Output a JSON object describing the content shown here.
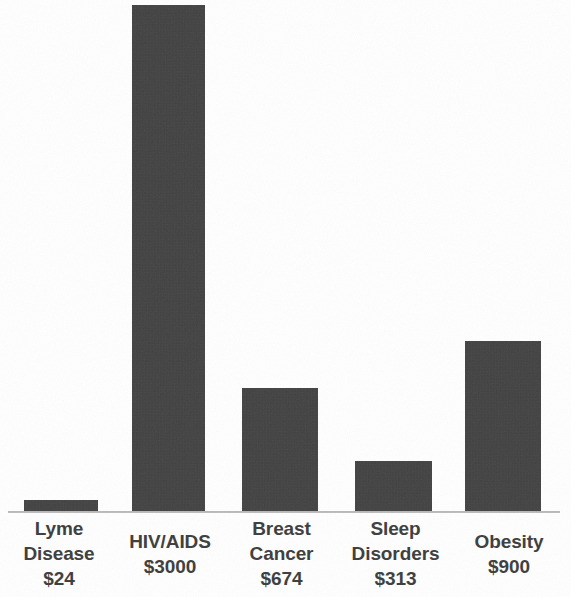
{
  "chart_data": {
    "type": "bar",
    "title": "",
    "subtitle": "",
    "xlabel": "",
    "ylabel": "",
    "categories": [
      "Lyme Disease",
      "HIV/AIDS",
      "Breast Cancer",
      "Sleep Disorders",
      "Obesity"
    ],
    "values": [
      24,
      3000,
      674,
      313,
      900
    ],
    "value_labels": [
      "$24",
      "$3000",
      "$674",
      "$313",
      "$900"
    ],
    "value_prefix": "$",
    "ylim": [
      0,
      3000
    ],
    "grid": false,
    "legend": null,
    "axis_line": true,
    "bars": [
      {
        "category": "Lyme Disease",
        "category_lines": [
          "Lyme",
          "Disease"
        ],
        "value": 24,
        "value_label": "$24",
        "x": 24,
        "width": 74,
        "height": 13,
        "color": "#3d3d3d"
      },
      {
        "category": "HIV/AIDS",
        "category_lines": [
          "HIV/AIDS"
        ],
        "value": 3000,
        "value_label": "$3000",
        "x": 132,
        "width": 73,
        "height": 508,
        "color": "#3d3d3d"
      },
      {
        "category": "Breast Cancer",
        "category_lines": [
          "Breast",
          "Cancer"
        ],
        "value": 674,
        "value_label": "$674",
        "x": 242,
        "width": 76,
        "height": 125,
        "color": "#3d3d3d"
      },
      {
        "category": "Sleep Disorders",
        "category_lines": [
          "Sleep",
          "Disorders"
        ],
        "value": 313,
        "value_label": "$313",
        "x": 355,
        "width": 77,
        "height": 52,
        "color": "#3d3d3d"
      },
      {
        "category": "Obesity",
        "category_lines": [
          "Obesity"
        ],
        "value": 900,
        "value_label": "$900",
        "x": 465,
        "width": 76,
        "height": 172,
        "color": "#3d3d3d"
      }
    ]
  },
  "colors": {
    "background": "#ffffff",
    "bar_fill": "#3d3d3d",
    "axis_line": "#b0b0b0",
    "label_text": "#3c3c3c"
  },
  "x_axis_labels": [
    {
      "line1": "Lyme",
      "line2": "Disease",
      "line3": "$24",
      "lines": 3,
      "left": 0,
      "width": 118
    },
    {
      "line1": "HIV/AIDS",
      "line2": "$3000",
      "line3": "",
      "lines": 2,
      "left": 113,
      "width": 114
    },
    {
      "line1": "Breast",
      "line2": "Cancer",
      "line3": "$674",
      "lines": 3,
      "left": 225,
      "width": 113
    },
    {
      "line1": "Sleep",
      "line2": "Disorders",
      "line3": "$313",
      "lines": 3,
      "left": 337,
      "width": 117
    },
    {
      "line1": "Obesity",
      "line2": "$900",
      "line3": "",
      "lines": 2,
      "left": 452,
      "width": 114
    }
  ]
}
